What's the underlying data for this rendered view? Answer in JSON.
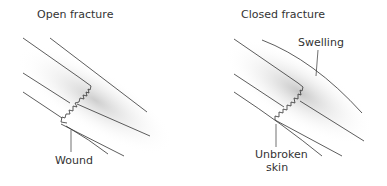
{
  "panels": [
    {
      "title": "Open fracture",
      "labels": [
        {
          "text": "Wound"
        }
      ]
    },
    {
      "title": "Closed fracture",
      "labels": [
        {
          "text": "Swelling"
        },
        {
          "text": "Unbroken"
        },
        {
          "text": "skin"
        }
      ]
    }
  ]
}
